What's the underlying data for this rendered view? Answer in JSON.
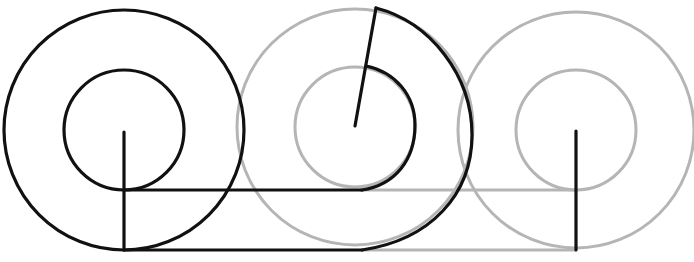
{
  "diagram": {
    "title": "Rolling concentric circles (Aristotle's wheel)",
    "colors": {
      "active": "#111111",
      "ghost": "#b5b5b5",
      "background": "#ffffff"
    },
    "outer_radius": 120,
    "inner_radius": 60,
    "ground_outer_y": 250,
    "ground_inner_y": 190,
    "wheels": [
      {
        "id": "start",
        "cx": 124,
        "cy": 130,
        "style": "active",
        "radius_end": [
          124,
          250
        ]
      },
      {
        "id": "middle",
        "cx": 355,
        "cy": 127,
        "style": "ghost",
        "radius_end": [
          376,
          8
        ]
      },
      {
        "id": "end",
        "cx": 576,
        "cy": 130,
        "style": "ghost",
        "radius_end": [
          576,
          250
        ]
      }
    ]
  }
}
